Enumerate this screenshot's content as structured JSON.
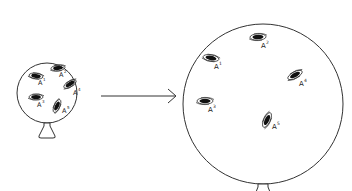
{
  "diagram": {
    "colors": {
      "stroke": "#333333",
      "galaxy": "#111111",
      "background": "#ffffff"
    },
    "small_balloon": {
      "galaxies": [
        {
          "label": "A",
          "sup": "1"
        },
        {
          "label": "A",
          "sup": "2"
        },
        {
          "label": "A",
          "sup": "3"
        },
        {
          "label": "A",
          "sup": "4"
        },
        {
          "label": "A",
          "sup": "5"
        }
      ]
    },
    "arrow": {
      "direction": "right"
    },
    "large_balloon": {
      "galaxies": [
        {
          "label": "A",
          "sup": "1"
        },
        {
          "label": "A",
          "sup": "2"
        },
        {
          "label": "A",
          "sup": "3"
        },
        {
          "label": "A",
          "sup": "4"
        },
        {
          "label": "A",
          "sup": "5"
        }
      ]
    }
  }
}
